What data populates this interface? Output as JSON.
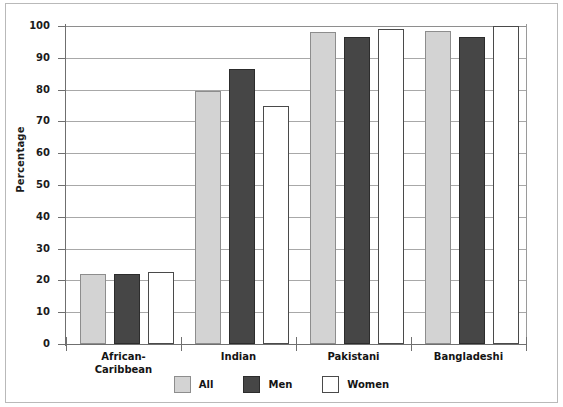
{
  "chart_data": {
    "type": "bar",
    "title": "",
    "xlabel": "",
    "ylabel": "Percentage",
    "ylim": [
      0,
      100
    ],
    "yticks": [
      0,
      10,
      20,
      30,
      40,
      50,
      60,
      70,
      80,
      90,
      100
    ],
    "ytick_labels": [
      "0",
      "10",
      "20",
      "30",
      "40",
      "50",
      "60",
      "70",
      "80",
      "90",
      "100"
    ],
    "grid": true,
    "legend_position": "bottom-center",
    "categories": [
      "African-Caribbean",
      "Indian",
      "Pakistani",
      "Bangladeshi"
    ],
    "category_lines": [
      [
        "African-",
        "Caribbean"
      ],
      [
        "Indian"
      ],
      [
        "Pakistani"
      ],
      [
        "Bangladeshi"
      ]
    ],
    "series": [
      {
        "name": "All",
        "color": "#d3d3d3",
        "values": [
          22.0,
          79.5,
          98.0,
          98.5
        ]
      },
      {
        "name": "Men",
        "color": "#464646",
        "values": [
          22.0,
          86.5,
          96.5,
          96.5
        ]
      },
      {
        "name": "Women",
        "color": "#ffffff",
        "values": [
          22.5,
          75.0,
          99.0,
          100.0
        ]
      }
    ]
  },
  "legend": {
    "items": [
      {
        "label": "All"
      },
      {
        "label": "Men"
      },
      {
        "label": "Women"
      }
    ]
  },
  "colors": {
    "all": "#d3d3d3",
    "men": "#464646",
    "women": "#ffffff",
    "grid": "#a8a8a8",
    "axis": "#6f6f6f",
    "text": "#141414"
  }
}
